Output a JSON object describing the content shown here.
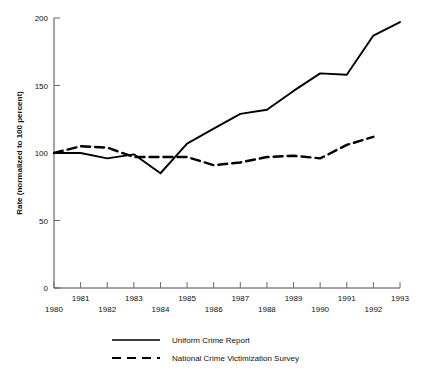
{
  "chart_data": {
    "type": "line",
    "title": "",
    "subtitle": "",
    "xlabel": "",
    "ylabel": "Rate (normalized to 100 percent)",
    "x": [
      1980,
      1981,
      1982,
      1983,
      1984,
      1985,
      1986,
      1987,
      1988,
      1989,
      1990,
      1991,
      1992,
      1993
    ],
    "xlim": [
      1980,
      1993
    ],
    "ylim": [
      0,
      200
    ],
    "yticks": [
      0,
      50,
      100,
      150,
      200
    ],
    "ytick_labels": [
      "0",
      "50",
      "100",
      "150",
      "200"
    ],
    "xticks": [
      1980,
      1981,
      1982,
      1983,
      1984,
      1985,
      1986,
      1987,
      1988,
      1989,
      1990,
      1991,
      1992,
      1993
    ],
    "xtick_labels": [
      "1980",
      "1981",
      "1982",
      "1983",
      "1984",
      "1985",
      "1986",
      "1987",
      "1988",
      "1989",
      "1990",
      "1991",
      "1992",
      "1993"
    ],
    "xtick_label_rows": [
      "lower",
      "upper",
      "lower",
      "upper",
      "lower",
      "upper",
      "lower",
      "upper",
      "lower",
      "upper",
      "lower",
      "upper",
      "lower",
      "upper"
    ],
    "grid": false,
    "legend_position": "below-plot",
    "series": [
      {
        "name": "Uniform Crime Report",
        "style": "solid",
        "color": "#000000",
        "x": [
          1980,
          1981,
          1982,
          1983,
          1984,
          1985,
          1986,
          1987,
          1988,
          1989,
          1990,
          1991,
          1992,
          1993
        ],
        "values": [
          100,
          100,
          96,
          99,
          85,
          107,
          118,
          129,
          132,
          146,
          159,
          158,
          187,
          197
        ]
      },
      {
        "name": "National Crime Victimization Survey",
        "style": "dashed",
        "color": "#000000",
        "x": [
          1980,
          1981,
          1982,
          1983,
          1984,
          1985,
          1986,
          1987,
          1988,
          1989,
          1990,
          1991,
          1992
        ],
        "values": [
          100,
          105,
          104,
          97,
          97,
          97,
          91,
          93,
          97,
          98,
          96,
          106,
          112
        ]
      }
    ]
  },
  "axes": {
    "y_axis_title": "Rate (normalized to 100 percent)"
  },
  "legend": {
    "entries": [
      {
        "label": "Uniform Crime Report",
        "style": "solid"
      },
      {
        "label": "National Crime Victimization Survey",
        "style": "dashed"
      }
    ]
  }
}
